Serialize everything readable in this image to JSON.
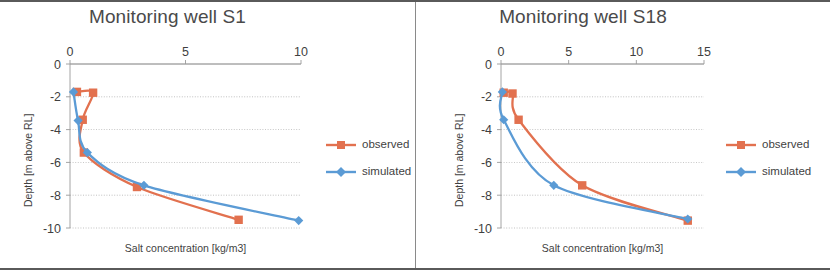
{
  "figure": {
    "background_color": "#ffffff",
    "border_color": "#5a5a5a",
    "divider_color": "#8a8a8a"
  },
  "colors": {
    "observed": "#e2714f",
    "simulated": "#5b9bd5",
    "gridline": "#9a9a9a",
    "axis": "#9a9a9a",
    "text": "#3f3f3f",
    "title_text": "#4a4a4a"
  },
  "legend": {
    "observed_label": "observed",
    "simulated_label": "simulated"
  },
  "chart_data": [
    {
      "type": "line",
      "panel": "left",
      "title": "Monitoring well S1",
      "xlabel": "Salt concentration [kg/m3]",
      "ylabel": "Depth [m above RL]",
      "xlim": [
        0,
        10
      ],
      "ylim": [
        -10,
        0
      ],
      "xticks": [
        0,
        5,
        10
      ],
      "xticklabels": [
        "0",
        "5",
        "10"
      ],
      "yticks": [
        0,
        -2,
        -4,
        -6,
        -8,
        -10
      ],
      "yticklabels": [
        "0",
        "-2",
        "-4",
        "-6",
        "-8",
        "-10"
      ],
      "grid": "horizontal",
      "xaxis_position": "top",
      "legend_position": "right",
      "series": [
        {
          "name": "observed",
          "color": "#e2714f",
          "marker": "square",
          "x": [
            0.3,
            1.0,
            0.55,
            0.6,
            2.9,
            7.3
          ],
          "y": [
            -1.7,
            -1.75,
            -3.4,
            -5.4,
            -7.5,
            -9.5
          ]
        },
        {
          "name": "simulated",
          "color": "#5b9bd5",
          "marker": "diamond",
          "x": [
            0.15,
            0.35,
            0.75,
            3.2,
            9.9
          ],
          "y": [
            -1.7,
            -3.45,
            -5.4,
            -7.4,
            -9.55
          ]
        }
      ]
    },
    {
      "type": "line",
      "panel": "right",
      "title": "Monitoring well S18",
      "xlabel": "Salt concentration [kg/m3]",
      "ylabel": "Depth [m above RL]",
      "xlim": [
        0,
        15
      ],
      "ylim": [
        -10,
        0
      ],
      "xticks": [
        0,
        5,
        10,
        15
      ],
      "xticklabels": [
        "0",
        "5",
        "10",
        "15"
      ],
      "yticks": [
        0,
        -2,
        -4,
        -6,
        -8,
        -10
      ],
      "yticklabels": [
        "0",
        "-2",
        "-4",
        "-6",
        "-8",
        "-10"
      ],
      "grid": "horizontal",
      "xaxis_position": "top",
      "legend_position": "right",
      "series": [
        {
          "name": "observed",
          "color": "#e2714f",
          "marker": "square",
          "x": [
            0.2,
            0.85,
            1.3,
            6.0,
            13.8
          ],
          "y": [
            -1.75,
            -1.8,
            -3.4,
            -7.4,
            -9.55
          ]
        },
        {
          "name": "simulated",
          "color": "#5b9bd5",
          "marker": "diamond",
          "x": [
            0.1,
            0.2,
            3.9,
            13.8
          ],
          "y": [
            -1.7,
            -3.4,
            -7.4,
            -9.45
          ]
        }
      ]
    }
  ]
}
